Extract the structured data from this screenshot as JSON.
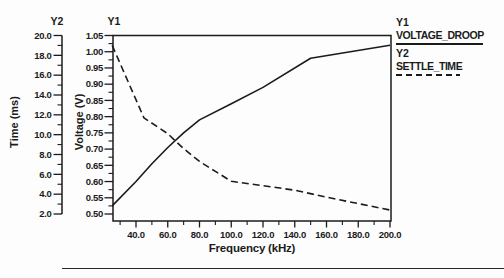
{
  "figure": {
    "bg": "#fdfdfd",
    "ink": "#1b1b1b"
  },
  "axes": {
    "y2": {
      "header": "Y2",
      "title": "Time (ms)",
      "tick_labels": [
        "20.0",
        "18.0",
        "16.0",
        "14.0",
        "12.0",
        "10.0",
        "8.0",
        "6.0",
        "4.0",
        "2.0"
      ],
      "tick_values": [
        20,
        18,
        16,
        14,
        12,
        10,
        8,
        6,
        4,
        2
      ],
      "minor_values": [
        19,
        17,
        15,
        13,
        11,
        9,
        7,
        5,
        3
      ],
      "range": [
        2.0,
        20.0
      ]
    },
    "y1": {
      "header": "Y1",
      "title": "Voltage (V)",
      "tick_labels": [
        "1.05",
        "1.00",
        "0.95",
        "0.90",
        "0.85",
        "0.80",
        "0.75",
        "0.70",
        "0.65",
        "0.60",
        "0.55",
        "0.50"
      ],
      "tick_values": [
        1.05,
        1.0,
        0.95,
        0.9,
        0.85,
        0.8,
        0.75,
        0.7,
        0.65,
        0.6,
        0.55,
        0.5
      ],
      "minor_values": [
        1.025,
        0.975,
        0.925,
        0.875,
        0.825,
        0.775,
        0.725,
        0.675,
        0.625,
        0.575,
        0.525
      ],
      "range": [
        0.5,
        1.05
      ]
    },
    "x": {
      "title": "Frequency (kHz)",
      "tick_labels": [
        "40.0",
        "60.0",
        "80.0",
        "100.0",
        "120.0",
        "140.0",
        "160.0",
        "180.0",
        "200.0"
      ],
      "tick_values": [
        40,
        60,
        80,
        100,
        120,
        140,
        160,
        180,
        200
      ],
      "minor_values": [
        30,
        50,
        70,
        90,
        110,
        130,
        150,
        170,
        190
      ],
      "range": [
        25.5,
        200.5
      ]
    }
  },
  "legend": {
    "items": [
      {
        "axis_label": "Y1",
        "name": "VOLTAGE_DROOP",
        "line_style": "solid"
      },
      {
        "axis_label": "Y2",
        "name": "SETTLE_TIME",
        "line_style": "dashed"
      }
    ]
  },
  "chart_data": {
    "type": "line",
    "title": "",
    "xlabel": "Frequency (kHz)",
    "x_range": [
      25,
      200
    ],
    "grid": false,
    "legend_position": "top-right",
    "y_axes": [
      {
        "id": "Y1",
        "label": "Voltage (V)",
        "range": [
          0.5,
          1.05
        ]
      },
      {
        "id": "Y2",
        "label": "Time (ms)",
        "range": [
          2.0,
          20.0
        ]
      }
    ],
    "series": [
      {
        "name": "VOLTAGE_DROOP",
        "axis": "Y1",
        "style": "solid",
        "x": [
          25,
          40,
          50,
          60,
          70,
          80,
          100,
          120,
          150,
          200
        ],
        "y": [
          0.525,
          0.6,
          0.655,
          0.705,
          0.75,
          0.79,
          0.84,
          0.89,
          0.98,
          1.02
        ]
      },
      {
        "name": "SETTLE_TIME",
        "axis": "Y2",
        "style": "dashed",
        "x": [
          25,
          45,
          60,
          70,
          80,
          90,
          100,
          120,
          140,
          160,
          180,
          200
        ],
        "y": [
          19.0,
          11.7,
          10.1,
          8.6,
          7.3,
          6.3,
          5.3,
          4.85,
          4.4,
          3.7,
          3.05,
          2.4
        ]
      }
    ]
  }
}
